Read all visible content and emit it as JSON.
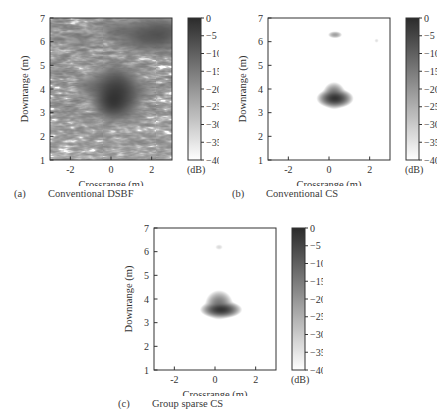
{
  "figure": {
    "background": "#ffffff",
    "ink": "#333333"
  },
  "colorbar": {
    "unit_label": "(dB)",
    "ticks": [
      0,
      -5,
      -10,
      -15,
      -20,
      -25,
      -30,
      -35,
      -40
    ],
    "tick_labels": [
      "0",
      "-5",
      "-10",
      "-15",
      "-20",
      "-25",
      "-30",
      "-35",
      "-40"
    ],
    "max": 0,
    "min": -40,
    "top_color": "#2b2b2b",
    "bottom_color": "#ffffff",
    "orientation": "vertical"
  },
  "axes": {
    "xlabel": "Crossrange (m)",
    "ylabel": "Downrange (m)",
    "xlim": [
      -3,
      3
    ],
    "ylim": [
      1,
      7
    ],
    "xticks": [
      -2,
      0,
      2
    ],
    "xtick_labels": [
      "-2",
      "0",
      "2"
    ],
    "yticks": [
      1,
      2,
      3,
      4,
      5,
      6,
      7
    ],
    "ytick_labels": [
      "1",
      "2",
      "3",
      "4",
      "5",
      "6",
      "7"
    ],
    "grid": false
  },
  "panels": [
    {
      "id": "a",
      "letter": "(a)",
      "title": "Conventional DSBF",
      "noise_level": "high",
      "description": "Speckled backscatter image with diffuse clutter across the scene"
    },
    {
      "id": "b",
      "letter": "(b)",
      "title": "Conventional CS",
      "noise_level": "none",
      "description": "Sparse reconstruction with one compact target and one faint artifact"
    },
    {
      "id": "c",
      "letter": "(c)",
      "title": "Group sparse CS",
      "noise_level": "none",
      "description": "Sparse reconstruction with a single compact target"
    }
  ],
  "chart_data": {
    "type": "heatmap",
    "title": "",
    "xlabel": "Crossrange (m)",
    "ylabel": "Downrange (m)",
    "xlim": [
      -3,
      3
    ],
    "ylim": [
      1,
      7
    ],
    "zlim": [
      -40,
      0
    ],
    "zlabel": "(dB)",
    "colormap": "gray_reversed",
    "panels": [
      {
        "id": "a",
        "label": "Conventional DSBF",
        "targets": [
          {
            "x": 0.25,
            "y": 3.8,
            "amplitude_db": -3,
            "sigma_x": 0.45,
            "sigma_y": 0.42
          },
          {
            "x": 0.1,
            "y": 3.45,
            "amplitude_db": -5,
            "sigma_x": 0.3,
            "sigma_y": 0.25
          },
          {
            "x": -0.9,
            "y": 4.1,
            "amplitude_db": -14,
            "sigma_x": 0.4,
            "sigma_y": 0.22
          },
          {
            "x": 1.3,
            "y": 3.95,
            "amplitude_db": -17,
            "sigma_x": 0.5,
            "sigma_y": 0.2
          },
          {
            "x": 1.9,
            "y": 6.25,
            "amplitude_db": -9,
            "sigma_x": 0.7,
            "sigma_y": 0.28
          },
          {
            "x": 2.6,
            "y": 6.4,
            "amplitude_db": -11,
            "sigma_x": 0.5,
            "sigma_y": 0.3
          },
          {
            "x": 0.4,
            "y": 6.55,
            "amplitude_db": -16,
            "sigma_x": 0.6,
            "sigma_y": 0.22
          },
          {
            "x": -1.5,
            "y": 6.1,
            "amplitude_db": -20,
            "sigma_x": 0.5,
            "sigma_y": 0.25
          },
          {
            "x": -0.2,
            "y": 5.0,
            "amplitude_db": -24,
            "sigma_x": 0.5,
            "sigma_y": 0.3
          }
        ],
        "clutter_amplitude_db": -27,
        "clutter_density": "high"
      },
      {
        "id": "b",
        "label": "Conventional CS",
        "targets": [
          {
            "x": 0.3,
            "y": 3.6,
            "amplitude_db": -2,
            "sigma_x": 0.22,
            "sigma_y": 0.1
          },
          {
            "x": 0.25,
            "y": 3.72,
            "amplitude_db": -12,
            "sigma_x": 0.16,
            "sigma_y": 0.16
          },
          {
            "x": 0.3,
            "y": 6.3,
            "amplitude_db": -22,
            "sigma_x": 0.12,
            "sigma_y": 0.05
          },
          {
            "x": 2.35,
            "y": 6.05,
            "amplitude_db": -34,
            "sigma_x": 0.06,
            "sigma_y": 0.05
          }
        ],
        "clutter_amplitude_db": -40,
        "clutter_density": "none"
      },
      {
        "id": "c",
        "label": "Group sparse CS",
        "targets": [
          {
            "x": 0.3,
            "y": 3.55,
            "amplitude_db": -2,
            "sigma_x": 0.25,
            "sigma_y": 0.09
          },
          {
            "x": 0.2,
            "y": 3.75,
            "amplitude_db": -14,
            "sigma_x": 0.2,
            "sigma_y": 0.18
          },
          {
            "x": 0.2,
            "y": 6.2,
            "amplitude_db": -33,
            "sigma_x": 0.1,
            "sigma_y": 0.06
          }
        ],
        "clutter_amplitude_db": -40,
        "clutter_density": "none"
      }
    ]
  }
}
